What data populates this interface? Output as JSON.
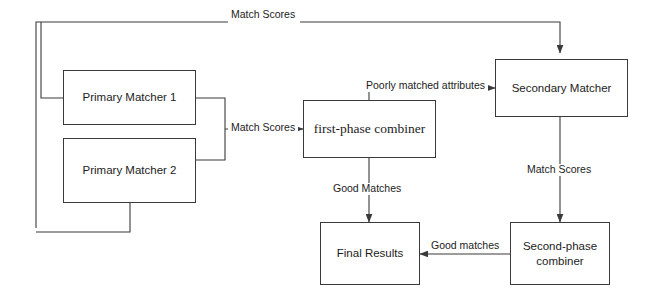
{
  "diagram": {
    "stroke_color": "#3a3a3a",
    "text_color": "#1c1c1c",
    "background_color": "#ffffff",
    "nodes": [
      {
        "id": "primary-matcher-1",
        "label": "Primary Matcher 1"
      },
      {
        "id": "primary-matcher-2",
        "label": "Primary Matcher 2"
      },
      {
        "id": "first-phase-combiner",
        "label": "first-phase combiner"
      },
      {
        "id": "secondary-matcher",
        "label": "Secondary Matcher"
      },
      {
        "id": "second-phase-combiner",
        "label": "Second-phase\ncombiner"
      },
      {
        "id": "final-results",
        "label": "Final Results"
      }
    ],
    "edge_labels": {
      "top_match_scores": "Match Scores",
      "primary_match_scores": "Match Scores",
      "poorly_matched_attributes": "Poorly matched attributes",
      "good_matches_down": "Good Matches",
      "secondary_match_scores": "Match Scores",
      "good_matches_left": "Good matches"
    }
  }
}
